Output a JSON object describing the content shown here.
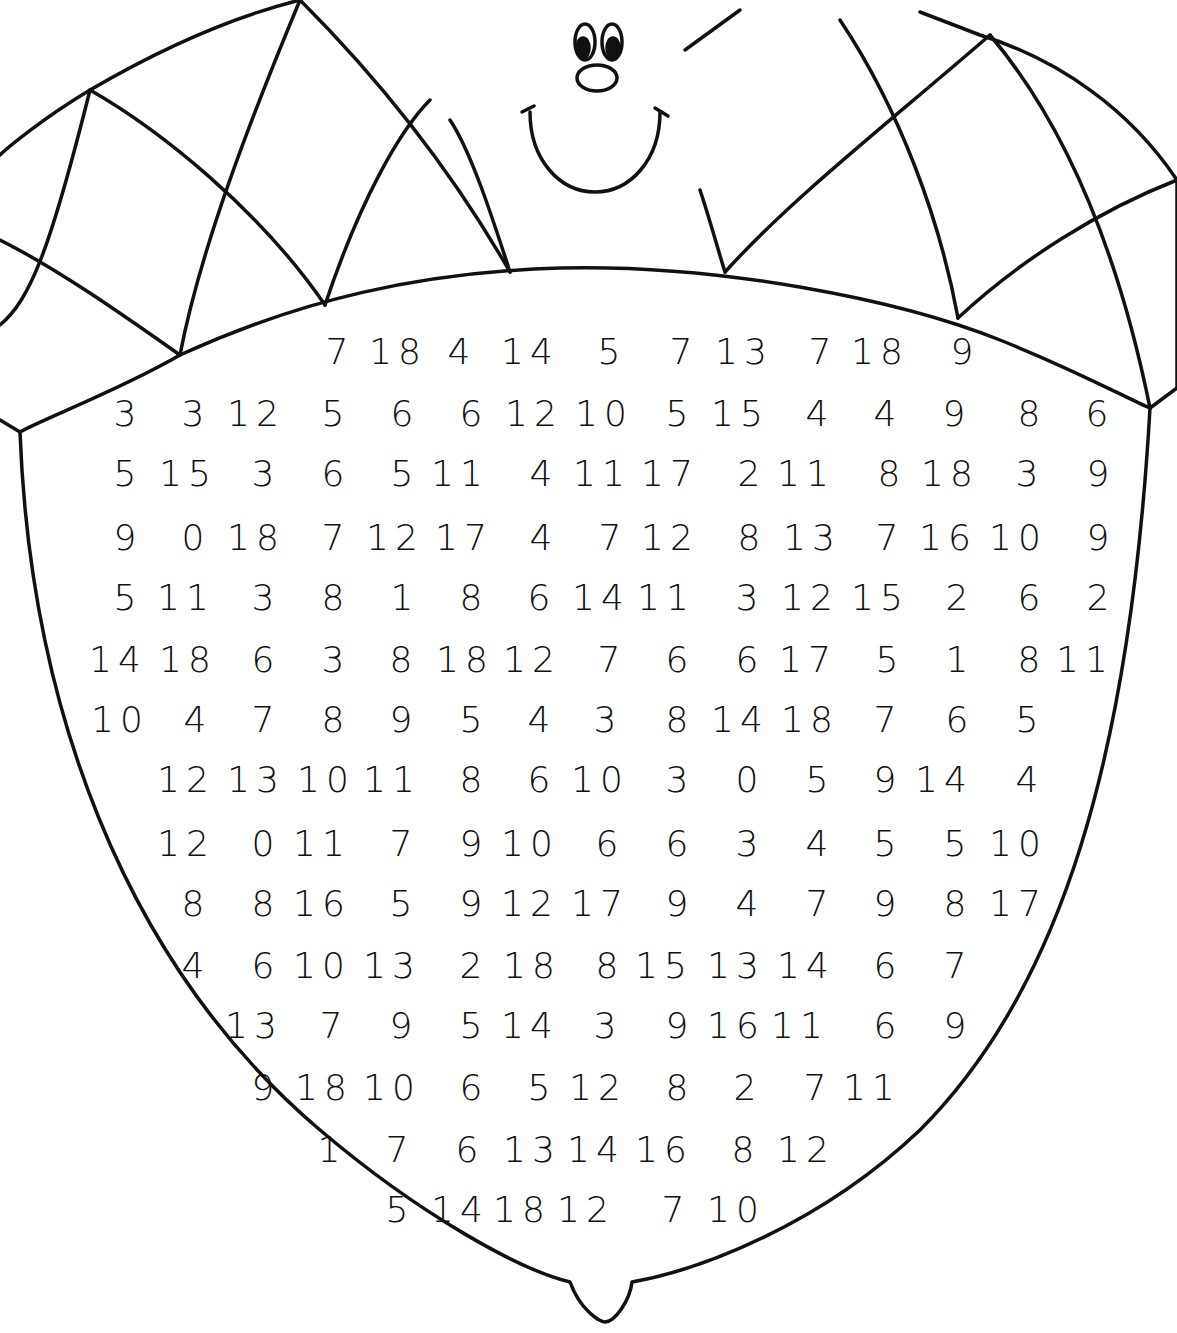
{
  "worksheet": {
    "subject": "acorn coloring number puzzle",
    "colors": {
      "ink": "#111111",
      "paper": "#ffffff"
    },
    "face": {
      "eyes": 2,
      "nose": "oval",
      "mouth": "smile"
    },
    "rows": [
      {
        "y": 352,
        "cells": [
          {
            "x": 340,
            "v": "7"
          },
          {
            "x": 398,
            "v": "18"
          },
          {
            "x": 462,
            "v": "4"
          },
          {
            "x": 530,
            "v": "14"
          },
          {
            "x": 612,
            "v": "5"
          },
          {
            "x": 684,
            "v": "7"
          },
          {
            "x": 744,
            "v": "13"
          },
          {
            "x": 823,
            "v": "7"
          },
          {
            "x": 880,
            "v": "18"
          },
          {
            "x": 965,
            "v": "9"
          }
        ]
      },
      {
        "y": 414,
        "cells": [
          {
            "x": 128,
            "v": "3"
          },
          {
            "x": 196,
            "v": "3"
          },
          {
            "x": 256,
            "v": "12"
          },
          {
            "x": 336,
            "v": "5"
          },
          {
            "x": 405,
            "v": "6"
          },
          {
            "x": 474,
            "v": "6"
          },
          {
            "x": 534,
            "v": "12"
          },
          {
            "x": 604,
            "v": "10"
          },
          {
            "x": 680,
            "v": "5"
          },
          {
            "x": 740,
            "v": "15"
          },
          {
            "x": 820,
            "v": "4"
          },
          {
            "x": 888,
            "v": "4"
          },
          {
            "x": 957,
            "v": "9"
          },
          {
            "x": 1032,
            "v": "8"
          },
          {
            "x": 1100,
            "v": "6"
          }
        ]
      },
      {
        "y": 474,
        "cells": [
          {
            "x": 128,
            "v": "5"
          },
          {
            "x": 188,
            "v": "15"
          },
          {
            "x": 266,
            "v": "3"
          },
          {
            "x": 336,
            "v": "6"
          },
          {
            "x": 405,
            "v": "5"
          },
          {
            "x": 460,
            "v": "11"
          },
          {
            "x": 544,
            "v": "4"
          },
          {
            "x": 602,
            "v": "11"
          },
          {
            "x": 670,
            "v": "17"
          },
          {
            "x": 752,
            "v": "2"
          },
          {
            "x": 806,
            "v": "11"
          },
          {
            "x": 892,
            "v": "8"
          },
          {
            "x": 950,
            "v": "18"
          },
          {
            "x": 1030,
            "v": "3"
          },
          {
            "x": 1101,
            "v": "9"
          }
        ]
      },
      {
        "y": 538,
        "cells": [
          {
            "x": 128,
            "v": "9"
          },
          {
            "x": 196,
            "v": "0"
          },
          {
            "x": 256,
            "v": "18"
          },
          {
            "x": 336,
            "v": "7"
          },
          {
            "x": 395,
            "v": "12"
          },
          {
            "x": 464,
            "v": "17"
          },
          {
            "x": 544,
            "v": "4"
          },
          {
            "x": 613,
            "v": "7"
          },
          {
            "x": 670,
            "v": "12"
          },
          {
            "x": 752,
            "v": "8"
          },
          {
            "x": 812,
            "v": "13"
          },
          {
            "x": 890,
            "v": "7"
          },
          {
            "x": 948,
            "v": "16"
          },
          {
            "x": 1018,
            "v": "10"
          },
          {
            "x": 1101,
            "v": "9"
          }
        ]
      },
      {
        "y": 598,
        "cells": [
          {
            "x": 128,
            "v": "5"
          },
          {
            "x": 186,
            "v": "11"
          },
          {
            "x": 266,
            "v": "3"
          },
          {
            "x": 336,
            "v": "8"
          },
          {
            "x": 405,
            "v": "1"
          },
          {
            "x": 474,
            "v": "8"
          },
          {
            "x": 542,
            "v": "6"
          },
          {
            "x": 601,
            "v": "14"
          },
          {
            "x": 666,
            "v": "11"
          },
          {
            "x": 750,
            "v": "3"
          },
          {
            "x": 810,
            "v": "12"
          },
          {
            "x": 880,
            "v": "15"
          },
          {
            "x": 960,
            "v": "2"
          },
          {
            "x": 1032,
            "v": "6"
          },
          {
            "x": 1101,
            "v": "2"
          }
        ]
      },
      {
        "y": 660,
        "cells": [
          {
            "x": 118,
            "v": "14"
          },
          {
            "x": 188,
            "v": "18"
          },
          {
            "x": 266,
            "v": "6"
          },
          {
            "x": 336,
            "v": "3"
          },
          {
            "x": 404,
            "v": "8"
          },
          {
            "x": 465,
            "v": "18"
          },
          {
            "x": 532,
            "v": "12"
          },
          {
            "x": 612,
            "v": "7"
          },
          {
            "x": 680,
            "v": "6"
          },
          {
            "x": 750,
            "v": "6"
          },
          {
            "x": 808,
            "v": "17"
          },
          {
            "x": 890,
            "v": "5"
          },
          {
            "x": 960,
            "v": "1"
          },
          {
            "x": 1032,
            "v": "8"
          },
          {
            "x": 1085,
            "v": "11"
          }
        ]
      },
      {
        "y": 720,
        "cells": [
          {
            "x": 120,
            "v": "10"
          },
          {
            "x": 198,
            "v": "4"
          },
          {
            "x": 266,
            "v": "7"
          },
          {
            "x": 336,
            "v": "8"
          },
          {
            "x": 404,
            "v": "9"
          },
          {
            "x": 474,
            "v": "5"
          },
          {
            "x": 542,
            "v": "4"
          },
          {
            "x": 608,
            "v": "3"
          },
          {
            "x": 680,
            "v": "8"
          },
          {
            "x": 740,
            "v": "14"
          },
          {
            "x": 810,
            "v": "18"
          },
          {
            "x": 888,
            "v": "7"
          },
          {
            "x": 960,
            "v": "6"
          },
          {
            "x": 1030,
            "v": "5"
          }
        ]
      },
      {
        "y": 780,
        "cells": [
          {
            "x": 186,
            "v": "12"
          },
          {
            "x": 256,
            "v": "13"
          },
          {
            "x": 326,
            "v": "10"
          },
          {
            "x": 392,
            "v": "11"
          },
          {
            "x": 474,
            "v": "8"
          },
          {
            "x": 542,
            "v": "6"
          },
          {
            "x": 600,
            "v": "10"
          },
          {
            "x": 680,
            "v": "3"
          },
          {
            "x": 750,
            "v": "0"
          },
          {
            "x": 820,
            "v": "5"
          },
          {
            "x": 888,
            "v": "9"
          },
          {
            "x": 944,
            "v": "14"
          },
          {
            "x": 1030,
            "v": "4"
          }
        ]
      },
      {
        "y": 844,
        "cells": [
          {
            "x": 186,
            "v": "12"
          },
          {
            "x": 266,
            "v": "0"
          },
          {
            "x": 322,
            "v": "11"
          },
          {
            "x": 404,
            "v": "7"
          },
          {
            "x": 474,
            "v": "9"
          },
          {
            "x": 530,
            "v": "10"
          },
          {
            "x": 610,
            "v": "6"
          },
          {
            "x": 680,
            "v": "6"
          },
          {
            "x": 750,
            "v": "3"
          },
          {
            "x": 820,
            "v": "4"
          },
          {
            "x": 888,
            "v": "5"
          },
          {
            "x": 958,
            "v": "5"
          },
          {
            "x": 1018,
            "v": "10"
          }
        ]
      },
      {
        "y": 904,
        "cells": [
          {
            "x": 196,
            "v": "8"
          },
          {
            "x": 266,
            "v": "8"
          },
          {
            "x": 322,
            "v": "16"
          },
          {
            "x": 404,
            "v": "5"
          },
          {
            "x": 474,
            "v": "9"
          },
          {
            "x": 530,
            "v": "12"
          },
          {
            "x": 600,
            "v": "17"
          },
          {
            "x": 680,
            "v": "9"
          },
          {
            "x": 750,
            "v": "4"
          },
          {
            "x": 820,
            "v": "7"
          },
          {
            "x": 888,
            "v": "9"
          },
          {
            "x": 958,
            "v": "8"
          },
          {
            "x": 1018,
            "v": "17"
          }
        ]
      },
      {
        "y": 966,
        "cells": [
          {
            "x": 196,
            "v": "4"
          },
          {
            "x": 266,
            "v": "6"
          },
          {
            "x": 322,
            "v": "10"
          },
          {
            "x": 392,
            "v": "13"
          },
          {
            "x": 474,
            "v": "2"
          },
          {
            "x": 532,
            "v": "18"
          },
          {
            "x": 610,
            "v": "8"
          },
          {
            "x": 664,
            "v": "15"
          },
          {
            "x": 736,
            "v": "13"
          },
          {
            "x": 806,
            "v": "14"
          },
          {
            "x": 888,
            "v": "6"
          },
          {
            "x": 958,
            "v": "7"
          }
        ]
      },
      {
        "y": 1026,
        "cells": [
          {
            "x": 254,
            "v": "13"
          },
          {
            "x": 334,
            "v": "7"
          },
          {
            "x": 404,
            "v": "9"
          },
          {
            "x": 474,
            "v": "5"
          },
          {
            "x": 530,
            "v": "14"
          },
          {
            "x": 608,
            "v": "3"
          },
          {
            "x": 680,
            "v": "9"
          },
          {
            "x": 736,
            "v": "16"
          },
          {
            "x": 800,
            "v": "11"
          },
          {
            "x": 888,
            "v": "6"
          },
          {
            "x": 958,
            "v": "9"
          }
        ]
      },
      {
        "y": 1088,
        "cells": [
          {
            "x": 266,
            "v": "9"
          },
          {
            "x": 324,
            "v": "18"
          },
          {
            "x": 392,
            "v": "10"
          },
          {
            "x": 474,
            "v": "6"
          },
          {
            "x": 542,
            "v": "5"
          },
          {
            "x": 598,
            "v": "12"
          },
          {
            "x": 680,
            "v": "8"
          },
          {
            "x": 748,
            "v": "2"
          },
          {
            "x": 818,
            "v": "7"
          },
          {
            "x": 872,
            "v": "11"
          }
        ]
      },
      {
        "y": 1150,
        "cells": [
          {
            "x": 332,
            "v": "1"
          },
          {
            "x": 400,
            "v": "7"
          },
          {
            "x": 470,
            "v": "6"
          },
          {
            "x": 532,
            "v": "13"
          },
          {
            "x": 596,
            "v": "14"
          },
          {
            "x": 664,
            "v": "16"
          },
          {
            "x": 746,
            "v": "8"
          },
          {
            "x": 806,
            "v": "12"
          }
        ]
      },
      {
        "y": 1210,
        "cells": [
          {
            "x": 400,
            "v": "5"
          },
          {
            "x": 460,
            "v": "14"
          },
          {
            "x": 522,
            "v": "18"
          },
          {
            "x": 586,
            "v": "12"
          },
          {
            "x": 676,
            "v": "7"
          },
          {
            "x": 736,
            "v": "10"
          }
        ]
      }
    ]
  }
}
